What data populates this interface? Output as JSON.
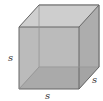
{
  "diagram": {
    "type": "cube",
    "labels": {
      "height": "s",
      "width": "s",
      "depth": "s"
    },
    "colors": {
      "face_fill": "#b8b8b8",
      "bottom_fill": "#8c8c8c",
      "edge": "#666666",
      "label": "#333333"
    }
  }
}
